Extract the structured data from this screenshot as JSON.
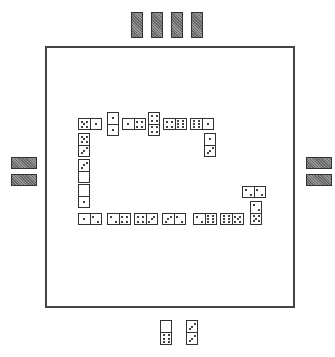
{
  "game": "Dominoes",
  "board": {
    "border_color": "#444444",
    "background": "#ffffff"
  },
  "opponents": {
    "top": {
      "position": "top",
      "tiles_in_hand": 4
    },
    "left": {
      "position": "left",
      "tiles_in_hand": 2
    },
    "right": {
      "position": "right",
      "tiles_in_hand": 2
    }
  },
  "player_hand": [
    {
      "a": 0,
      "b": 6
    },
    {
      "a": 3,
      "b": 3
    }
  ],
  "chain": [
    {
      "a": 5,
      "b": 1,
      "x": 78,
      "y": 118,
      "orient": "h"
    },
    {
      "a": 1,
      "b": 1,
      "x": 107,
      "y": 112,
      "orient": "v"
    },
    {
      "a": 1,
      "b": 4,
      "x": 122,
      "y": 118,
      "orient": "h"
    },
    {
      "a": 4,
      "b": 4,
      "x": 148,
      "y": 112,
      "orient": "v"
    },
    {
      "a": 4,
      "b": 6,
      "x": 163,
      "y": 118,
      "orient": "h"
    },
    {
      "a": 6,
      "b": 1,
      "x": 190,
      "y": 118,
      "orient": "h"
    },
    {
      "a": 1,
      "b": 3,
      "x": 204,
      "y": 133,
      "orient": "v"
    },
    {
      "a": 5,
      "b": 3,
      "x": 78,
      "y": 133,
      "orient": "v"
    },
    {
      "a": 3,
      "b": 0,
      "x": 78,
      "y": 159,
      "orient": "v"
    },
    {
      "a": 0,
      "b": 1,
      "x": 78,
      "y": 184,
      "orient": "v"
    },
    {
      "a": 1,
      "b": 2,
      "x": 78,
      "y": 213,
      "orient": "h"
    },
    {
      "a": 2,
      "b": 4,
      "x": 107,
      "y": 213,
      "orient": "h"
    },
    {
      "a": 4,
      "b": 3,
      "x": 134,
      "y": 213,
      "orient": "h"
    },
    {
      "a": 3,
      "b": 2,
      "x": 162,
      "y": 213,
      "orient": "h"
    },
    {
      "a": 2,
      "b": 6,
      "x": 193,
      "y": 213,
      "orient": "h"
    },
    {
      "a": 6,
      "b": 5,
      "x": 220,
      "y": 213,
      "orient": "h"
    },
    {
      "a": 2,
      "b": 5,
      "x": 250,
      "y": 201,
      "orient": "v"
    },
    {
      "a": 2,
      "b": 2,
      "x": 242,
      "y": 186,
      "orient": "h"
    }
  ]
}
